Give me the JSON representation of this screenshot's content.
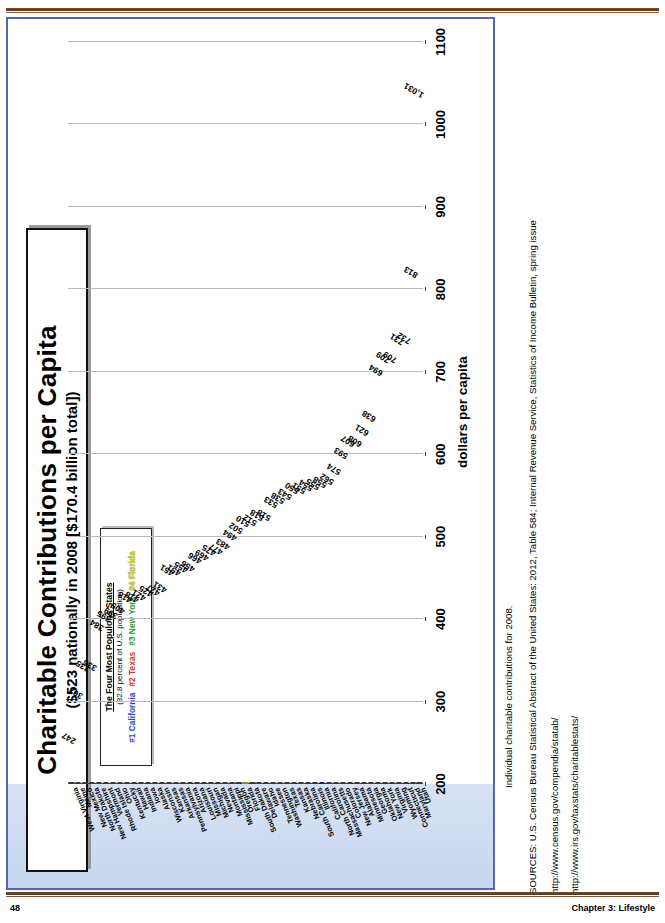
{
  "page": {
    "number": "48",
    "chapter": "Chapter 3: Lifestyle"
  },
  "figure": {
    "title": "Charitable Contributions per Capita",
    "subtitle": "($523 nationally in 2008 [$170.4 billion total])",
    "legend": {
      "title": "The Four Most Populous States",
      "note": "(32.8 percent of U.S. population)",
      "entries": [
        {
          "rank": "#1",
          "state": "California",
          "color": "#2f47c9"
        },
        {
          "rank": "#2",
          "state": "Texas",
          "color": "#d4341b"
        },
        {
          "rank": "#3",
          "state": "New York",
          "color": "#2e9b2e"
        },
        {
          "rank": "#4",
          "state": "Florida",
          "color": "#cfd21a"
        }
      ]
    }
  },
  "sources": {
    "note": "Individual charitable contributions for 2008.",
    "citation": "SOURCES: U.S. Census Bureau Statistical Abstract of the United States: 2012, Table 584; Internal Revenue Service, Statistics of Income Bulletin, spring issue",
    "url1": "http://www.census.gov/compendia/statab/",
    "url2": "http://www.irs.gov/taxstats/charitablestats/"
  },
  "chart_data": {
    "type": "bar",
    "orientation": "horizontal",
    "title": "Charitable Contributions per Capita",
    "subtitle": "($523 nationally in 2008 [$170.4 billion total])",
    "xlabel": "dollars per capita",
    "ylabel": "",
    "xlim": [
      200,
      1100
    ],
    "xticks": [
      1100,
      1000,
      900,
      800,
      700,
      600,
      500,
      400,
      300,
      200
    ],
    "grid": true,
    "legend_position": "top-left",
    "categories": [
      "Utah",
      "Maryland",
      "Connecticut",
      "Wyoming",
      "Virginia",
      "New York",
      "Oklahoma",
      "Georgia",
      "Minnesota",
      "Alabama",
      "New Jersey",
      "Colorado",
      "Massachusetts",
      "North Carolina",
      "California",
      "Illinois",
      "South Carolina",
      "Nebraska",
      "Kansas",
      "Texas",
      "Washington",
      "Tennessee",
      "Idaho",
      "Delaware",
      "South Dakota",
      "Florida",
      "Oregon",
      "Mississippi",
      "Montana",
      "Nevada",
      "Michigan",
      "Missouri",
      "Louisiana",
      "Arizona",
      "Pennsylvania",
      "Arkansas",
      "Kansas2",
      "Wisconsin",
      "Alaska",
      "Iowa",
      "Indiana",
      "Hawaii",
      "Kentucky",
      "Ohio",
      "Rhode Island",
      "Vermont",
      "New Hampshire",
      "North Dakota",
      "New Mexico",
      "Maine",
      "West Virginia"
    ],
    "values": [
      1031,
      813,
      732,
      731,
      709,
      709,
      694,
      638,
      621,
      608,
      607,
      593,
      574,
      562,
      558,
      555,
      554,
      551,
      550,
      543,
      538,
      533,
      518,
      518,
      512,
      510,
      502,
      494,
      483,
      477,
      475,
      469,
      466,
      456,
      455,
      451,
      451,
      431,
      427,
      425,
      421,
      418,
      418,
      405,
      399,
      395,
      384,
      336,
      335,
      302,
      247
    ],
    "highlighted": {
      "California": "#2434b4",
      "Texas": "#c9331a",
      "New York": "#1f7e1f",
      "Florida": "#c8cf16"
    }
  },
  "axis": {
    "label": "dollars per capita"
  }
}
